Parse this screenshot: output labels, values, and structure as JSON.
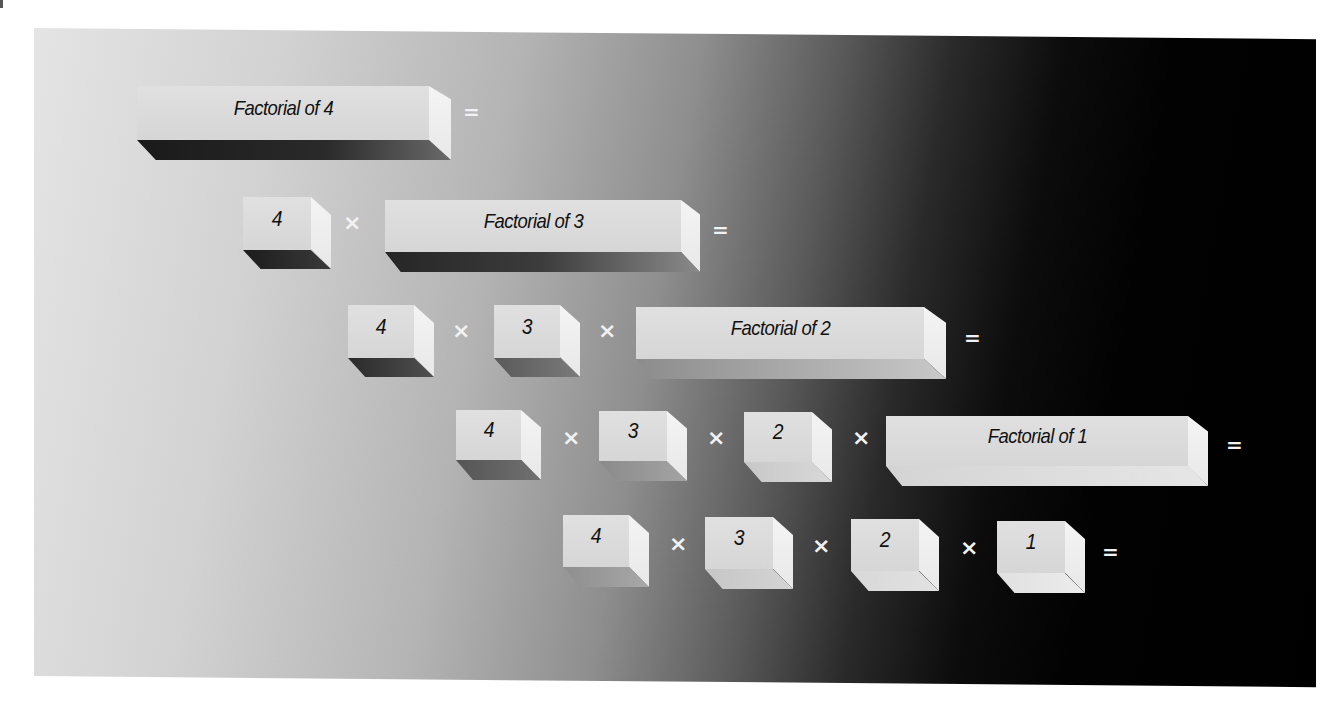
{
  "diagram": {
    "rows": [
      {
        "terms": [
          "Factorial of 4"
        ],
        "operators": [],
        "result_sign": "="
      },
      {
        "terms": [
          "4",
          "Factorial of 3"
        ],
        "operators": [
          "×"
        ],
        "result_sign": "="
      },
      {
        "terms": [
          "4",
          "3",
          "Factorial of 2"
        ],
        "operators": [
          "×",
          "×"
        ],
        "result_sign": "="
      },
      {
        "terms": [
          "4",
          "3",
          "2",
          "Factorial of 1"
        ],
        "operators": [
          "×",
          "×",
          "×"
        ],
        "result_sign": "="
      },
      {
        "terms": [
          "4",
          "3",
          "2",
          "1"
        ],
        "operators": [
          "×",
          "×",
          "×"
        ],
        "result_sign": "="
      }
    ],
    "colors": {
      "block_face": "#dcdcdc",
      "block_side": "#f0f0f0",
      "shadow_dark": "#1e1e1e",
      "background_light": "#e4e4e4",
      "background_dark": "#000000",
      "operator": "#f2f2f2",
      "label": "#111111"
    }
  }
}
